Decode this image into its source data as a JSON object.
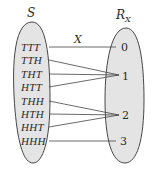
{
  "diagram": {
    "domain_set": {
      "label": "S",
      "elements": [
        "TTT",
        "TTH",
        "THT",
        "HTT",
        "THH",
        "HTH",
        "HHT",
        "HHH"
      ]
    },
    "range_set": {
      "label": "R",
      "label_subscript": "X",
      "elements": [
        "0",
        "1",
        "2",
        "3"
      ]
    },
    "mapping_label": "X",
    "mappings": [
      {
        "from": "TTT",
        "to": "0"
      },
      {
        "from": "TTH",
        "to": "1"
      },
      {
        "from": "THT",
        "to": "1"
      },
      {
        "from": "HTT",
        "to": "1"
      },
      {
        "from": "THH",
        "to": "2"
      },
      {
        "from": "HTH",
        "to": "2"
      },
      {
        "from": "HHT",
        "to": "2"
      },
      {
        "from": "HHH",
        "to": "3"
      }
    ],
    "colors": {
      "set_fill": "#e4e4e4",
      "set_stroke": "#333333",
      "line": "#444444",
      "text": "#2a2a2a"
    }
  }
}
